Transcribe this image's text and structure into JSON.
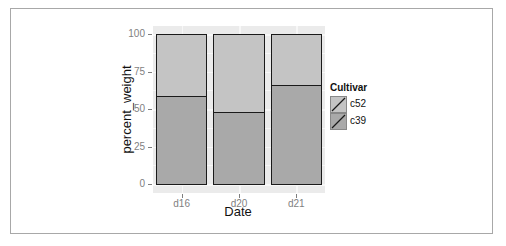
{
  "chart_data": {
    "type": "bar",
    "stacked": true,
    "title": "",
    "xlabel": "Date",
    "ylabel": "percent_weight",
    "categories": [
      "d16",
      "d20",
      "d21"
    ],
    "series": [
      {
        "name": "c39",
        "values": [
          59,
          48,
          66
        ],
        "color": "#a9a9a9"
      },
      {
        "name": "c52",
        "values": [
          41,
          52,
          34
        ],
        "color": "#c4c4c4"
      }
    ],
    "ylim": [
      0,
      100
    ],
    "yticks": [
      0,
      25,
      50,
      75,
      100
    ],
    "yticks_labels": [
      "0",
      "25",
      "50",
      "75",
      "100"
    ],
    "grid": true,
    "legend": {
      "title": "Cultivar",
      "position": "right",
      "entries": [
        {
          "label": "c52",
          "color": "#c4c4c4"
        },
        {
          "label": "c39",
          "color": "#a9a9a9"
        }
      ]
    },
    "panel_background": "#ebebeb"
  }
}
